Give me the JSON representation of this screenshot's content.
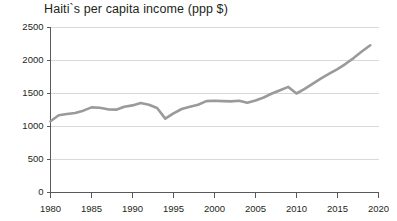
{
  "chart_data": {
    "type": "line",
    "title": "Haiti`s per capita income (ppp $)",
    "xlabel": "",
    "ylabel": "",
    "xlim": [
      1980,
      2020
    ],
    "ylim": [
      0,
      2500
    ],
    "grid": "horizontal",
    "legend": "none",
    "line_color": "#9a9a9a",
    "grid_color": "#d9d9d9",
    "axis_color": "#58595b",
    "text_color": "#231f20",
    "background_color": "#ffffff",
    "y_ticks": [
      0,
      500,
      1000,
      1500,
      2000,
      2500
    ],
    "y_tick_labels": [
      "0",
      "500",
      "1000",
      "1500",
      "2000",
      "2500"
    ],
    "x_ticks": [
      1980,
      1985,
      1990,
      1995,
      2000,
      2005,
      2010,
      2015,
      2020
    ],
    "x_tick_labels": [
      "1980",
      "1985",
      "1990",
      "1995",
      "2000",
      "2005",
      "2010",
      "2015",
      "2020"
    ],
    "series": [
      {
        "name": "Haiti per capita income (ppp $)",
        "x": [
          1980,
          1981,
          1982,
          1983,
          1984,
          1985,
          1986,
          1987,
          1988,
          1989,
          1990,
          1991,
          1992,
          1993,
          1994,
          1995,
          1996,
          1997,
          1998,
          1999,
          2000,
          2001,
          2002,
          2003,
          2004,
          2005,
          2006,
          2007,
          2008,
          2009,
          2010,
          2011,
          2012,
          2013,
          2014,
          2015,
          2016,
          2017,
          2018,
          2019
        ],
        "values": [
          1080,
          1170,
          1190,
          1205,
          1240,
          1290,
          1285,
          1260,
          1255,
          1300,
          1320,
          1355,
          1330,
          1280,
          1120,
          1200,
          1265,
          1300,
          1330,
          1385,
          1390,
          1385,
          1380,
          1390,
          1360,
          1395,
          1440,
          1500,
          1550,
          1600,
          1500,
          1570,
          1650,
          1730,
          1800,
          1870,
          1950,
          2040,
          2140,
          2230
        ]
      }
    ]
  }
}
